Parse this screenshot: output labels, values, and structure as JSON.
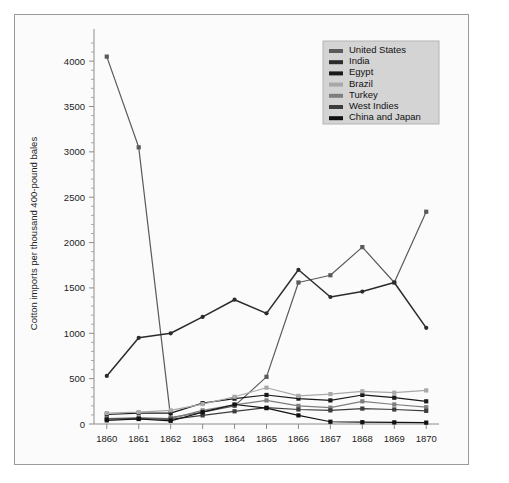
{
  "chart_data": {
    "type": "line",
    "title": "",
    "xlabel": "",
    "ylabel": "Cotton imports per thousand 400-pound bales",
    "x": [
      1860,
      1861,
      1862,
      1863,
      1864,
      1865,
      1866,
      1867,
      1868,
      1869,
      1870
    ],
    "xtick_labels": [
      "1860",
      "1861",
      "1862",
      "1863",
      "1864",
      "1865",
      "1866",
      "1867",
      "1868",
      "1869",
      "1870"
    ],
    "ytick_labels": [
      "0",
      "500",
      "1000",
      "1500",
      "2000",
      "2500",
      "3000",
      "3500",
      "4000"
    ],
    "ytick_values": [
      0,
      500,
      1000,
      1500,
      2000,
      2500,
      3000,
      3500,
      4000
    ],
    "ylim": [
      0,
      4200
    ],
    "xlim": [
      1859.6,
      1870.4
    ],
    "grid": false,
    "legend_position": "top-right",
    "series": [
      {
        "name": "United States",
        "color": "#5a5a5a",
        "marker": "square",
        "values": [
          4050,
          3050,
          70,
          130,
          200,
          520,
          1560,
          1640,
          1950,
          1560,
          2340
        ]
      },
      {
        "name": "India",
        "color": "#2b2b2b",
        "marker": "circle",
        "values": [
          530,
          950,
          1000,
          1180,
          1370,
          1220,
          1700,
          1400,
          1460,
          1560,
          1060
        ]
      },
      {
        "name": "Egypt",
        "color": "#1a1a1a",
        "marker": "square",
        "values": [
          105,
          120,
          120,
          230,
          280,
          320,
          280,
          260,
          320,
          290,
          250
        ]
      },
      {
        "name": "Brazil",
        "color": "#a8a8a8",
        "marker": "square",
        "values": [
          120,
          130,
          150,
          220,
          300,
          400,
          310,
          330,
          360,
          345,
          370
        ]
      },
      {
        "name": "Turkey",
        "color": "#7e7e7e",
        "marker": "square",
        "values": [
          60,
          70,
          60,
          150,
          210,
          260,
          200,
          180,
          250,
          215,
          185
        ]
      },
      {
        "name": "West Indies",
        "color": "#3c3c3c",
        "marker": "square",
        "values": [
          55,
          60,
          50,
          95,
          140,
          180,
          160,
          150,
          170,
          160,
          145
        ]
      },
      {
        "name": "China and Japan",
        "color": "#111111",
        "marker": "square",
        "values": [
          40,
          55,
          35,
          130,
          215,
          175,
          95,
          25,
          20,
          18,
          15
        ]
      }
    ],
    "legend_entries": [
      {
        "label": "United States",
        "color": "#5a5a5a"
      },
      {
        "label": "India",
        "color": "#2b2b2b"
      },
      {
        "label": "Egypt",
        "color": "#1a1a1a"
      },
      {
        "label": "Brazil",
        "color": "#a8a8a8"
      },
      {
        "label": "Turkey",
        "color": "#7e7e7e"
      },
      {
        "label": "West Indies",
        "color": "#3c3c3c"
      },
      {
        "label": "China and Japan",
        "color": "#111111"
      }
    ]
  }
}
